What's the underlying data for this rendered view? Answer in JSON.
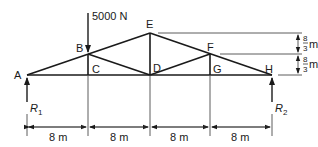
{
  "diagram": {
    "type": "truss",
    "load": {
      "label": "5000 N",
      "at_joint": "B"
    },
    "joints": {
      "A": "A",
      "B": "B",
      "C": "C",
      "D": "D",
      "E": "E",
      "F": "F",
      "G": "G",
      "H": "H"
    },
    "reactions": {
      "R1": {
        "main": "R",
        "sub": "1"
      },
      "R2": {
        "main": "R",
        "sub": "2"
      }
    },
    "horizontal_dimensions": [
      "8 m",
      "8 m",
      "8 m",
      "8 m"
    ],
    "vertical_dimensions": [
      {
        "num": "8",
        "den": "3",
        "unit": "m"
      },
      {
        "num": "8",
        "den": "3",
        "unit": "m"
      }
    ]
  }
}
